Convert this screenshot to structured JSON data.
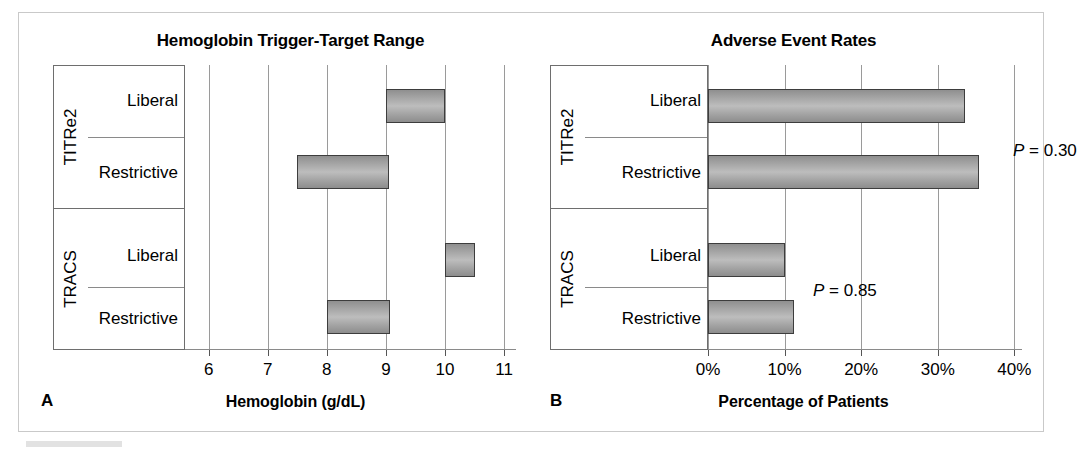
{
  "figure": {
    "panels": [
      {
        "letter": "A",
        "title": "Hemoglobin Trigger-Target Range",
        "axis_title": "Hemoglobin (g/dL)"
      },
      {
        "letter": "B",
        "title": "Adverse Event Rates",
        "axis_title": "Percentage of Patients"
      }
    ],
    "trials": [
      {
        "name": "TITRe2",
        "arms": [
          "Liberal",
          "Restrictive"
        ]
      },
      {
        "name": "TRACS",
        "arms": [
          "Liberal",
          "Restrictive"
        ]
      }
    ]
  },
  "chart_data": [
    {
      "type": "bar",
      "orientation": "horizontal",
      "style": "range-bar",
      "title": "Hemoglobin Trigger-Target Range",
      "panel_letter": "A",
      "xlabel": "Hemoglobin (g/dL)",
      "ylabel": "",
      "xlim": [
        5.6,
        11.2
      ],
      "xticks": [
        6,
        7,
        8,
        9,
        10,
        11
      ],
      "xtick_labels": [
        "6",
        "7",
        "8",
        "9",
        "10",
        "11"
      ],
      "grid": true,
      "legend": "none",
      "categories": [
        "TITRe2 Liberal",
        "TITRe2 Restrictive",
        "TRACS Liberal",
        "TRACS Restrictive"
      ],
      "bars": [
        {
          "group": "TITRe2",
          "arm": "Liberal",
          "start": 9.0,
          "end": 10.0
        },
        {
          "group": "TITRe2",
          "arm": "Restrictive",
          "start": 7.5,
          "end": 9.05
        },
        {
          "group": "TRACS",
          "arm": "Liberal",
          "start": 10.0,
          "end": 10.5
        },
        {
          "group": "TRACS",
          "arm": "Restrictive",
          "start": 8.0,
          "end": 9.07
        }
      ]
    },
    {
      "type": "bar",
      "orientation": "horizontal",
      "title": "Adverse Event Rates",
      "panel_letter": "B",
      "xlabel": "Percentage of Patients",
      "ylabel": "",
      "xlim": [
        0,
        41
      ],
      "xticks": [
        0,
        10,
        20,
        30,
        40
      ],
      "xtick_labels": [
        "0%",
        "10%",
        "20%",
        "30%",
        "40%"
      ],
      "grid": true,
      "legend": "none",
      "categories": [
        "TITRe2 Liberal",
        "TITRe2 Restrictive",
        "TRACS Liberal",
        "TRACS Restrictive"
      ],
      "values": [
        33.5,
        35.4,
        10.1,
        11.2
      ],
      "bars": [
        {
          "group": "TITRe2",
          "arm": "Liberal",
          "start": 0,
          "end": 33.5
        },
        {
          "group": "TITRe2",
          "arm": "Restrictive",
          "start": 0,
          "end": 35.4
        },
        {
          "group": "TRACS",
          "arm": "Liberal",
          "start": 0,
          "end": 10.1
        },
        {
          "group": "TRACS",
          "arm": "Restrictive",
          "start": 0,
          "end": 11.2
        }
      ],
      "annotations": [
        {
          "text": "P = 0.30",
          "p_label": "P",
          "p_value": "= 0.30",
          "group": "TITRe2"
        },
        {
          "text": "P = 0.85",
          "p_label": "P",
          "p_value": "= 0.85",
          "group": "TRACS"
        }
      ]
    }
  ]
}
